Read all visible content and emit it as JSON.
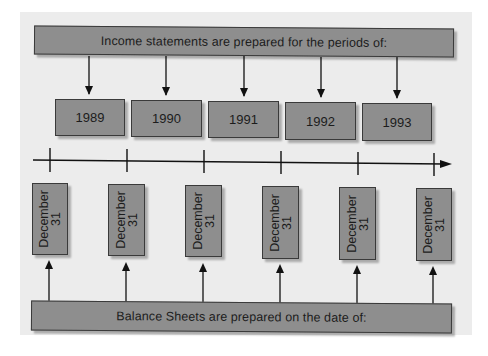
{
  "diagram": {
    "top_banner": {
      "label": "Income statements are prepared for the periods of:"
    },
    "periods": [
      {
        "label": "1989"
      },
      {
        "label": "1990"
      },
      {
        "label": "1991"
      },
      {
        "label": "1992"
      },
      {
        "label": "1993"
      }
    ],
    "dates": [
      {
        "line1": "December",
        "line2": "31"
      },
      {
        "line1": "December",
        "line2": "31"
      },
      {
        "line1": "December",
        "line2": "31"
      },
      {
        "line1": "December",
        "line2": "31"
      },
      {
        "line1": "December",
        "line2": "31"
      },
      {
        "line1": "December",
        "line2": "31"
      }
    ],
    "bottom_banner": {
      "label": "Balance Sheets are prepared on the date of:"
    },
    "colors": {
      "box_fill": "#8e8e8e",
      "panel_bg": "#ececec",
      "line": "#111111"
    }
  }
}
